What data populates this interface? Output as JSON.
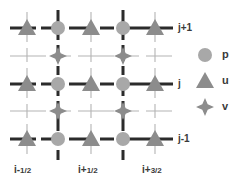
{
  "figure": {
    "kind": "staggered-grid-diagram",
    "background": "#ffffff"
  },
  "colors": {
    "p_fill": "#a8a8a8",
    "u_fill": "#8c8c8c",
    "v_fill": "#8c8c8c",
    "dark_line": "#2b2b2b",
    "light_line": "#b4b4b4",
    "text": "#3a3a3a"
  },
  "geometry": {
    "u_columns_x": [
      27,
      91,
      155
    ],
    "p_columns_x": [
      58,
      123
    ],
    "u_rows_y": [
      28,
      84,
      139
    ],
    "v_rows_y": [
      56,
      111
    ],
    "marker_radius_p": 7,
    "marker_size_u": 9,
    "marker_size_v": 9
  },
  "row_labels": [
    {
      "text": "j+1",
      "x": 178,
      "y": 22
    },
    {
      "text": "j",
      "x": 178,
      "y": 78
    },
    {
      "text": "j-1",
      "x": 178,
      "y": 133
    }
  ],
  "column_labels": [
    {
      "base": "i-",
      "num": "1",
      "den": "2",
      "x": 14,
      "y": 164
    },
    {
      "base": "i+",
      "num": "1",
      "den": "2",
      "x": 78,
      "y": 164
    },
    {
      "base": "i+",
      "num": "3",
      "den": "2",
      "x": 142,
      "y": 164
    }
  ],
  "legend": {
    "items": [
      {
        "glyph": "circle",
        "label": "p",
        "icon_x": 205,
        "icon_y": 55,
        "label_x": 222,
        "label_y": 48
      },
      {
        "glyph": "triangle",
        "label": "u",
        "icon_x": 205,
        "icon_y": 81,
        "label_x": 222,
        "label_y": 74
      },
      {
        "glyph": "star4",
        "label": "v",
        "icon_x": 205,
        "icon_y": 107,
        "label_x": 222,
        "label_y": 100
      }
    ]
  },
  "nodes": {
    "p_label": "p",
    "u_label": "u",
    "v_label": "v"
  }
}
